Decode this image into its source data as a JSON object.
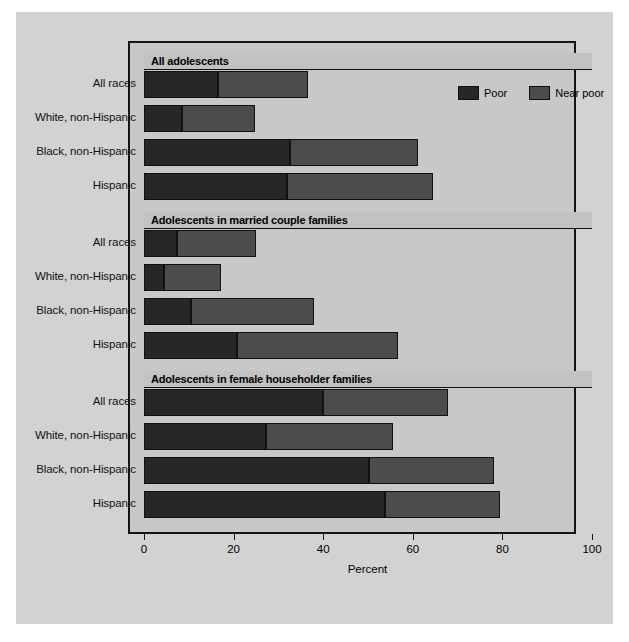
{
  "chart_data": {
    "type": "bar",
    "orientation": "horizontal",
    "stacked": true,
    "title": "",
    "xlabel": "Percent",
    "ylabel": "",
    "xlim": [
      0,
      100
    ],
    "xticks": [
      0,
      20,
      40,
      60,
      80,
      100
    ],
    "grid": false,
    "legend_position": "top-right",
    "legend": [
      {
        "name": "Poor",
        "color": "#272727"
      },
      {
        "name": "Near poor",
        "color": "#4c4c4c"
      }
    ],
    "categories": [
      "All races",
      "White, non-Hispanic",
      "Black, non-Hispanic",
      "Hispanic"
    ],
    "panels": [
      {
        "title": "All adolescents",
        "series": [
          {
            "name": "Poor",
            "values": [
              16.5,
              8.5,
              32.5,
              32.0
            ]
          },
          {
            "name": "Near poor",
            "values": [
              20.2,
              16.3,
              28.6,
              32.4
            ]
          }
        ],
        "totals": [
          36.7,
          24.8,
          61.1,
          64.4
        ]
      },
      {
        "title": "Adolescents in married couple families",
        "series": [
          {
            "name": "Poor",
            "values": [
              7.4,
              4.5,
              10.5,
              20.8
            ]
          },
          {
            "name": "Near poor",
            "values": [
              17.7,
              12.7,
              27.5,
              35.8
            ]
          }
        ],
        "totals": [
          25.1,
          17.2,
          38.0,
          56.6
        ]
      },
      {
        "title": "Adolescents in female householder families",
        "series": [
          {
            "name": "Poor",
            "values": [
              40.0,
              27.3,
              50.3,
              53.9
            ]
          },
          {
            "name": "Near poor",
            "values": [
              27.8,
              28.2,
              27.8,
              25.5
            ]
          }
        ],
        "totals": [
          67.8,
          55.5,
          78.1,
          79.4
        ]
      }
    ]
  }
}
